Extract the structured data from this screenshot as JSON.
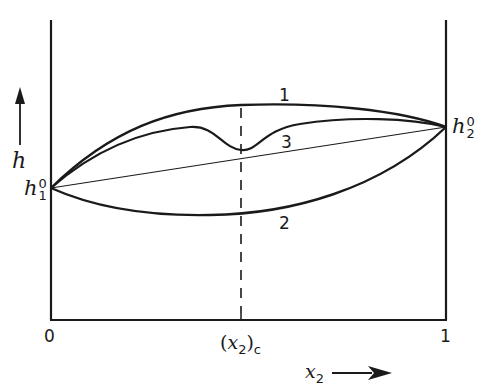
{
  "diagram": {
    "y_axis_label": "h",
    "x_axis_label_base": "x",
    "x_axis_label_sub": "2",
    "left_point": {
      "base": "h",
      "sup": "0",
      "sub": "1"
    },
    "right_point": {
      "base": "h",
      "sup": "0",
      "sub": "2"
    },
    "x_ticks": {
      "left": "0",
      "right": "1",
      "critical_open": "(",
      "critical_base": "x",
      "critical_sub": "2",
      "critical_close": ")",
      "critical_subscript": "c"
    },
    "curve_labels": {
      "curve1": "1",
      "curve2": "2",
      "curve3": "3"
    },
    "colors": {
      "ink": "#1a1a1a",
      "background": "#ffffff"
    }
  }
}
